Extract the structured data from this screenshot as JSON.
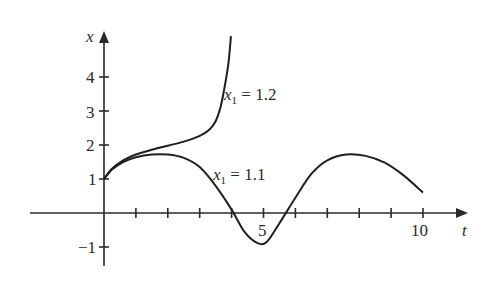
{
  "chart_data": {
    "type": "line",
    "title": "",
    "xlabel": "t",
    "ylabel": "x",
    "xlim": [
      -7.5,
      11
    ],
    "ylim": [
      -1.6,
      5.1
    ],
    "grid": false,
    "x_ticks": [
      1,
      2,
      3,
      4,
      5,
      6,
      7,
      8,
      9,
      10
    ],
    "x_tick_labels": [
      {
        "value": 5,
        "label": "5"
      },
      {
        "value": 10,
        "label": "10"
      }
    ],
    "y_ticks": [
      -1,
      1,
      2,
      3,
      4
    ],
    "y_tick_labels": [
      {
        "value": 4,
        "label": "4"
      },
      {
        "value": 3,
        "label": "3"
      },
      {
        "value": 2,
        "label": "2"
      },
      {
        "value": 1,
        "label": "1"
      },
      {
        "value": -1,
        "label": "−1"
      }
    ],
    "series": [
      {
        "name": "x1 = 1.2",
        "annotation": {
          "var": "x",
          "sub": "1",
          "rest": " = 1.2"
        },
        "points": [
          [
            0,
            1
          ],
          [
            0.25,
            1.3
          ],
          [
            0.6,
            1.55
          ],
          [
            1,
            1.72
          ],
          [
            1.5,
            1.86
          ],
          [
            2,
            1.98
          ],
          [
            2.5,
            2.1
          ],
          [
            3,
            2.27
          ],
          [
            3.3,
            2.45
          ],
          [
            3.5,
            2.7
          ],
          [
            3.65,
            3.1
          ],
          [
            3.78,
            3.7
          ],
          [
            3.9,
            4.4
          ],
          [
            3.98,
            5.2
          ]
        ]
      },
      {
        "name": "x1 = 1.1",
        "annotation": {
          "var": "x",
          "sub": "1",
          "rest": " = 1.1"
        },
        "points": [
          [
            0,
            1
          ],
          [
            0.25,
            1.28
          ],
          [
            0.6,
            1.5
          ],
          [
            1,
            1.64
          ],
          [
            1.5,
            1.72
          ],
          [
            2,
            1.72
          ],
          [
            2.5,
            1.62
          ],
          [
            3,
            1.35
          ],
          [
            3.5,
            0.8
          ],
          [
            4,
            0.1
          ],
          [
            4.4,
            -0.55
          ],
          [
            4.8,
            -0.88
          ],
          [
            5.1,
            -0.85
          ],
          [
            5.5,
            -0.3
          ],
          [
            6,
            0.45
          ],
          [
            6.5,
            1.15
          ],
          [
            7,
            1.55
          ],
          [
            7.6,
            1.72
          ],
          [
            8.2,
            1.68
          ],
          [
            8.8,
            1.48
          ],
          [
            9.4,
            1.1
          ],
          [
            10,
            0.6
          ]
        ]
      }
    ]
  },
  "labels": {
    "x_axis": "t",
    "y_axis": "x",
    "tick_5": "5",
    "tick_10": "10",
    "tick_y4": "4",
    "tick_y3": "3",
    "tick_y2": "2",
    "tick_y1": "1",
    "tick_yneg1": "−1",
    "curve_a_var": "x",
    "curve_a_sub": "1",
    "curve_a_rest": " = 1.2",
    "curve_b_var": "x",
    "curve_b_sub": "1",
    "curve_b_rest": " = 1.1"
  }
}
